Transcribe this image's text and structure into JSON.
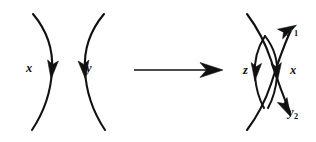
{
  "figure": {
    "background_color": "#ffffff",
    "ink_color": "#111111",
    "width": 316,
    "height": 142
  },
  "left_diagram": {
    "name": "before",
    "description": "Two disjoint vertical arcs bowing away from each other, each oriented downward",
    "labels": [
      {
        "id": "x",
        "text": "x",
        "sub": "",
        "left": 26,
        "top": 62
      },
      {
        "id": "y",
        "text": "y",
        "sub": "",
        "left": 86,
        "top": 62
      }
    ],
    "strands": [
      {
        "id": "arc-x",
        "label": "x",
        "orientation": "downward",
        "bulge": "right",
        "path": "M 33 14 C 49 33 53 54 52 70 C 51 92 44 112 32 130"
      },
      {
        "id": "arc-y",
        "label": "y",
        "orientation": "downward",
        "bulge": "left",
        "path": "M 104 14 C 88 33 84 54 85 70 C 86 92 93 112 105 130"
      }
    ],
    "arrowheads": [
      {
        "id": "arrow-x",
        "cx": 52,
        "cy": 70,
        "angle": 96
      },
      {
        "id": "arrow-y",
        "cx": 84.5,
        "cy": 70,
        "angle": 84
      }
    ]
  },
  "transform_arrow": {
    "name": "transformation-arrow",
    "direction": "right",
    "x_start": 134,
    "x_end": 222,
    "y": 70
  },
  "right_diagram": {
    "name": "after",
    "description": "Two crossing arcs forming a bigon, with inner arcs z and x oriented downward and outer ends labelled y1 and y2",
    "labels": [
      {
        "id": "z",
        "text": "z",
        "sub": "",
        "left": 243,
        "top": 64
      },
      {
        "id": "x",
        "text": "x",
        "sub": "",
        "left": 290,
        "top": 64
      },
      {
        "id": "y1",
        "text": "y",
        "sub": "1",
        "left": 288,
        "top": 23
      },
      {
        "id": "y2",
        "text": "y",
        "sub": "2",
        "left": 288,
        "top": 106
      }
    ],
    "strands": [
      {
        "id": "long-arc-descending",
        "from": "top-left",
        "to": "bottom-right",
        "orientation": "downward",
        "path": "M 247 14 C 259 30 266 45 271 60 C 277 79 283 96 290 112"
      },
      {
        "id": "long-arc-ascending",
        "from": "bottom-left",
        "to": "top-right",
        "orientation": "upward",
        "path": "M 247 130 C 259 114 266 99 271 84 C 277 65 283 48 290 32"
      },
      {
        "id": "inner-arc-z",
        "label": "z",
        "orientation": "downward",
        "bulge": "left",
        "path": "M 265 36 C 256 50 254 64 255 76 C 256 89 259 99 264 108"
      },
      {
        "id": "inner-arc-x",
        "label": "x",
        "orientation": "downward",
        "bulge": "right",
        "path": "M 265 36 C 276 50 278 64 277 76 C 276 89 273 99 268 108"
      }
    ],
    "arrowheads": [
      {
        "id": "arrow-z",
        "cx": 256,
        "cy": 72,
        "angle": 96
      },
      {
        "id": "arrow-x",
        "cx": 277,
        "cy": 72,
        "angle": 84
      },
      {
        "id": "arrow-y1",
        "cx": 288,
        "cy": 30,
        "angle": -64
      },
      {
        "id": "arrow-y2",
        "cx": 286,
        "cy": 108,
        "angle": 63
      }
    ]
  }
}
